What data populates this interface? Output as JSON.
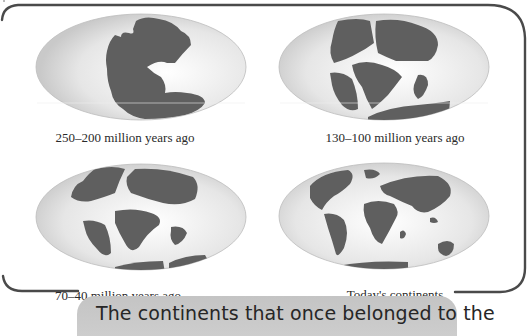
{
  "figure": {
    "panels": [
      {
        "id": "pangaea",
        "caption": "250–200 million years ago",
        "map_icon": "pangaea-map"
      },
      {
        "id": "breakup",
        "caption": "130–100 million years ago",
        "map_icon": "early-breakup-map"
      },
      {
        "id": "drift",
        "caption": "70–40 million years ago",
        "map_icon": "continental-drift-map"
      },
      {
        "id": "today",
        "caption": "Today's continents",
        "map_icon": "modern-world-map"
      }
    ],
    "bottom_caption": "The continents that once belonged to the",
    "colors": {
      "land": "#5f5f5f",
      "ocean_edge": "#cfcfcf",
      "ocean_center": "#ffffff",
      "frame": "#555555",
      "caption_box": "#c8c8c8"
    }
  }
}
